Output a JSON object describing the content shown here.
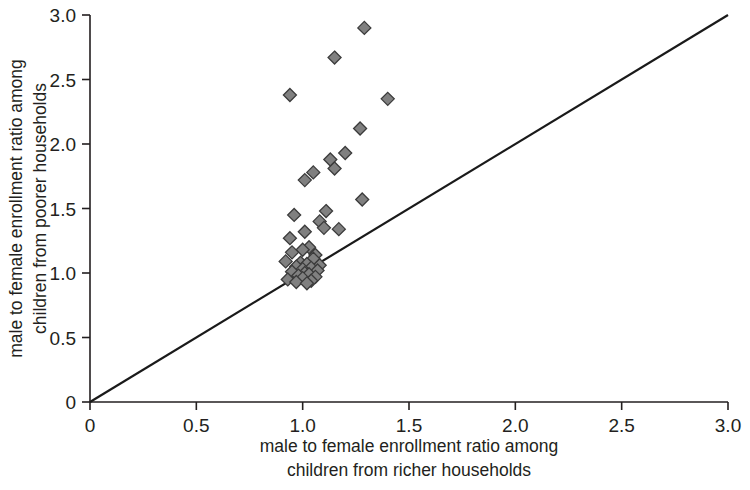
{
  "chart_data": {
    "type": "scatter",
    "title": "",
    "xlabel": "male to female enrollment ratio among children from richer households",
    "ylabel": "male to female enrollment ratio among children from poorer households",
    "xlabel_line1": "male to female enrollment ratio among",
    "xlabel_line2": "children from richer households",
    "ylabel_line1": "male to female enrollment ratio among",
    "ylabel_line2": "children from poorer households",
    "xlim": [
      0,
      3.0
    ],
    "ylim": [
      0,
      3.0
    ],
    "xticks": [
      0,
      0.5,
      1.0,
      1.5,
      2.0,
      2.5,
      3.0
    ],
    "yticks": [
      0,
      0.5,
      1.0,
      1.5,
      2.0,
      2.5,
      3.0
    ],
    "xtick_labels": [
      "0",
      "0.5",
      "1.0",
      "1.5",
      "2.0",
      "2.5",
      "3.0"
    ],
    "ytick_labels": [
      "0",
      "0.5",
      "1.0",
      "1.5",
      "2.0",
      "2.5",
      "3.0"
    ],
    "grid": false,
    "legend": false,
    "marker": "diamond",
    "marker_fill": "#808080",
    "marker_edge": "#3b3b3b",
    "marker_size": 13,
    "reference_line": {
      "label": "45 degree parity line",
      "from": [
        0,
        0
      ],
      "to": [
        3.0,
        3.0
      ],
      "color": "#1a1a1a"
    },
    "axis_color": "#231f20",
    "background": "#ffffff",
    "points": [
      [
        1.29,
        2.9
      ],
      [
        1.15,
        2.67
      ],
      [
        0.94,
        2.38
      ],
      [
        1.4,
        2.35
      ],
      [
        1.27,
        2.12
      ],
      [
        1.2,
        1.93
      ],
      [
        1.13,
        1.88
      ],
      [
        1.15,
        1.81
      ],
      [
        1.05,
        1.78
      ],
      [
        1.01,
        1.72
      ],
      [
        1.28,
        1.57
      ],
      [
        1.11,
        1.48
      ],
      [
        0.96,
        1.45
      ],
      [
        1.08,
        1.4
      ],
      [
        1.1,
        1.35
      ],
      [
        1.17,
        1.34
      ],
      [
        1.01,
        1.32
      ],
      [
        0.94,
        1.27
      ],
      [
        1.03,
        1.2
      ],
      [
        1.0,
        1.18
      ],
      [
        0.95,
        1.16
      ],
      [
        1.06,
        1.14
      ],
      [
        1.05,
        1.11
      ],
      [
        0.92,
        1.09
      ],
      [
        0.99,
        1.08
      ],
      [
        1.02,
        1.07
      ],
      [
        1.08,
        1.06
      ],
      [
        0.97,
        1.05
      ],
      [
        1.04,
        1.04
      ],
      [
        1.0,
        1.03
      ],
      [
        1.07,
        1.02
      ],
      [
        0.95,
        1.01
      ],
      [
        1.01,
        1.0
      ],
      [
        1.03,
        0.99
      ],
      [
        0.98,
        0.98
      ],
      [
        1.06,
        0.97
      ],
      [
        1.0,
        0.96
      ],
      [
        0.93,
        0.95
      ],
      [
        1.04,
        0.94
      ],
      [
        0.97,
        0.93
      ],
      [
        1.02,
        0.92
      ]
    ]
  }
}
